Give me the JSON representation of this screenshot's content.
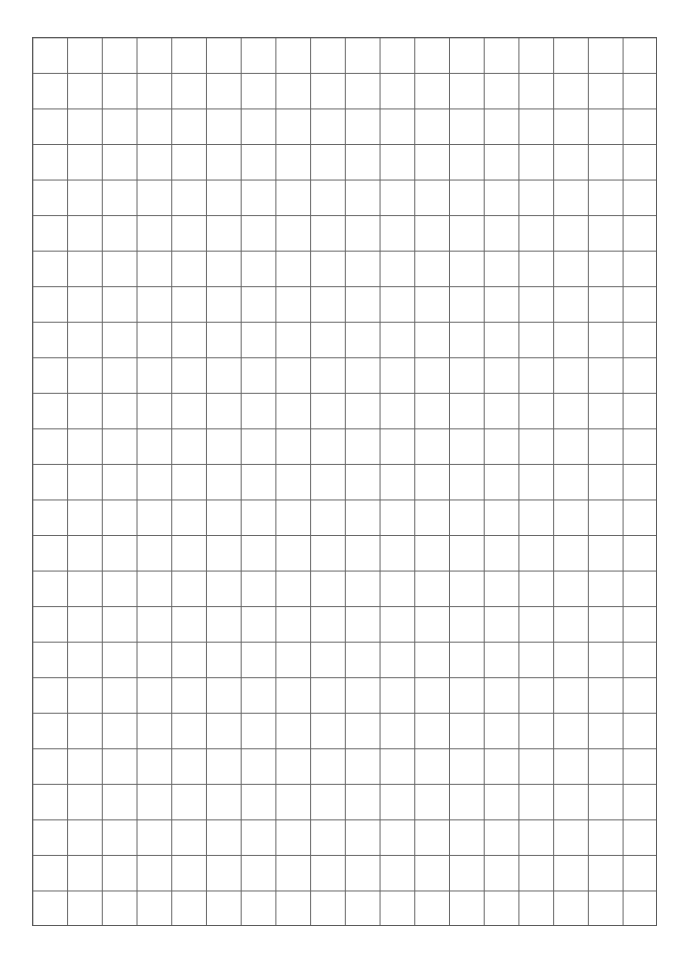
{
  "page": {
    "type": "graph-paper",
    "background_color": "#ffffff"
  },
  "grid": {
    "columns": 18,
    "rows": 25,
    "line_color": "#666666",
    "left": 32,
    "top": 37,
    "width": 625,
    "height": 889
  }
}
